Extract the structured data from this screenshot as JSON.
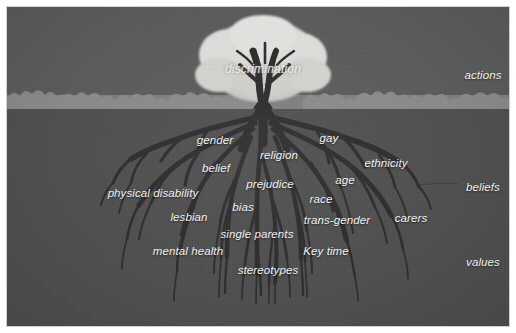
{
  "figure": {
    "title_text": "discrimination",
    "type": "tree-diagram",
    "colors": {
      "sky": "#5b5b5b",
      "ground_strip": "#7e7e7e",
      "earth": "#4f4f4f",
      "tree": "#2b2b2b",
      "canopy": "#d8d8d4",
      "text": "#f2f2f2",
      "border": "#cfcfcf"
    }
  },
  "canopy": {
    "label": "discrimination"
  },
  "side_labels": [
    {
      "text": "actions",
      "x": 476,
      "y": 68
    },
    {
      "text": "beliefs",
      "x": 476,
      "y": 180
    },
    {
      "text": "values",
      "x": 476,
      "y": 255
    }
  ],
  "root_labels": [
    {
      "text": "gender",
      "x": 208,
      "y": 133
    },
    {
      "text": "gay",
      "x": 322,
      "y": 131
    },
    {
      "text": "religion",
      "x": 272,
      "y": 148
    },
    {
      "text": "belief",
      "x": 209,
      "y": 161
    },
    {
      "text": "ethnicity",
      "x": 379,
      "y": 156
    },
    {
      "text": "age",
      "x": 338,
      "y": 173
    },
    {
      "text": "prejudice",
      "x": 263,
      "y": 177
    },
    {
      "text": "physical disability",
      "x": 146,
      "y": 186
    },
    {
      "text": "race",
      "x": 314,
      "y": 192
    },
    {
      "text": "bias",
      "x": 236,
      "y": 200
    },
    {
      "text": "lesbian",
      "x": 182,
      "y": 210
    },
    {
      "text": "trans-gender",
      "x": 330,
      "y": 213
    },
    {
      "text": "carers",
      "x": 404,
      "y": 211
    },
    {
      "text": "single parents",
      "x": 250,
      "y": 227
    },
    {
      "text": "mental health",
      "x": 181,
      "y": 244
    },
    {
      "text": "Key time",
      "x": 319,
      "y": 244
    },
    {
      "text": "stereotypes",
      "x": 261,
      "y": 263
    }
  ]
}
